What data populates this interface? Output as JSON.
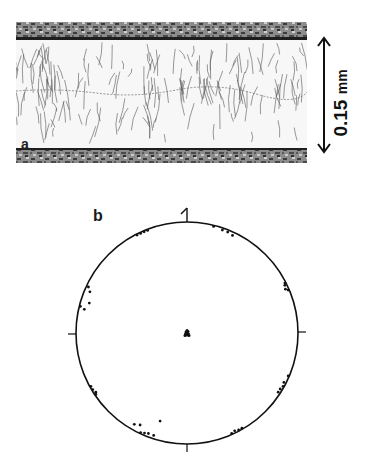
{
  "figure": {
    "panel_a": {
      "label": "a",
      "description": "optical micrograph of cross-section with dendritic grains between two dark granular bands",
      "scale_bar": {
        "value": "0.15",
        "unit": "mm"
      }
    },
    "panel_b": {
      "label": "b",
      "description": "stereographic pole figure: circle with four axis ticks, reference mark at top, pole clusters near the rim and at the center",
      "center_cluster": "dense cluster of poles at projection center",
      "rim_clusters": [
        "upper-left rim",
        "upper-right rim",
        "left rim (upper)",
        "left rim (lower)",
        "right rim (upper)",
        "right rim (lower)",
        "bottom-left rim",
        "bottom-right rim"
      ]
    }
  },
  "colors": {
    "ink": "#111111",
    "background": "#ffffff",
    "band_dark": "#3a3a3a",
    "band_light": "#9a9a9a"
  }
}
